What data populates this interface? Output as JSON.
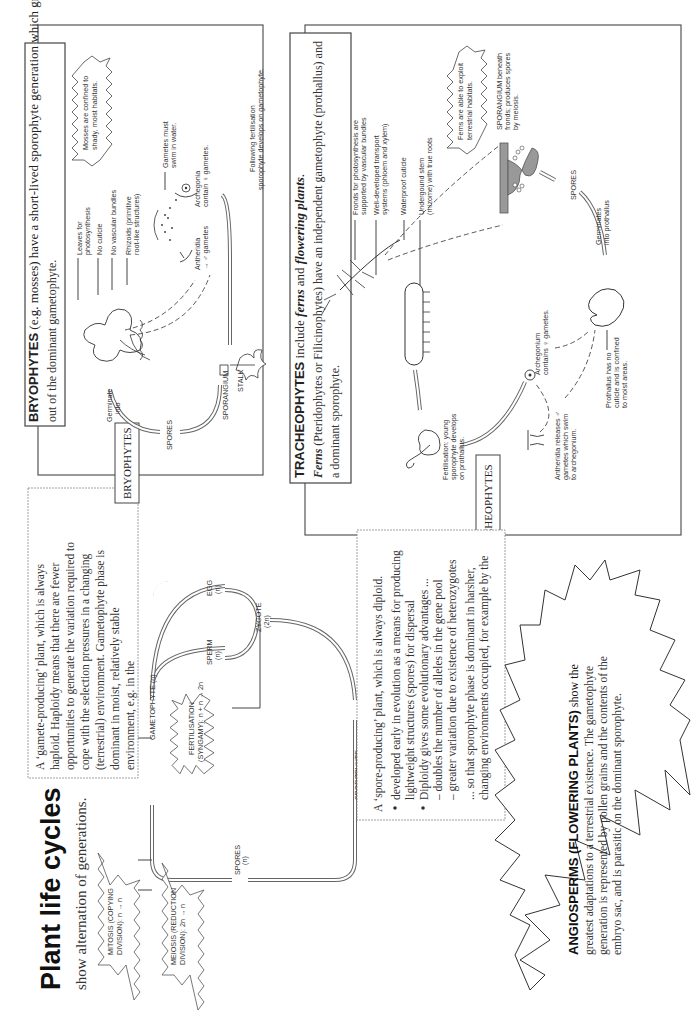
{
  "title": {
    "main": "Plant life cycles",
    "subtitle": "show alternation of generations."
  },
  "gametophyte_note": {
    "lines": [
      "A ‘gamete-producing’ plant, which is always",
      "haploid. Haploidy means that there are fewer",
      "opportunities to generate the variation required to",
      "cope with the selection pressures in a changing",
      "(terrestrial) environment. Gametophyte phase is",
      "dominant in moist, relatively stable",
      "environment, e.g. in the"
    ]
  },
  "sporophyte_note": {
    "intro": "A ‘spore-producing’ plant, which is always diploid.",
    "bullets": [
      {
        "lines": [
          "developed early in evolution as a means for producing",
          "lightweight structures (spores) for dispersal"
        ]
      },
      {
        "lines": [
          "Diploidy gives some evolutionary advantages ...",
          "– doubles the number of alleles in the gene pool",
          "– greater variation due to existence of heterozygotes"
        ]
      }
    ],
    "conclusion": [
      "... so that sporophyte phase is dominant in harsher,",
      "changing environments occupied, for example by the"
    ]
  },
  "cycle": {
    "gametophyte": "GAMETOPHYTE (n)",
    "sperm": [
      "SPERM",
      "(n)"
    ],
    "egg": [
      "EGG",
      "(n)"
    ],
    "zygote": [
      "ZYGOTE",
      "(2n)"
    ],
    "sporophyte": [
      "SPOROPHYTE",
      "(2n)"
    ],
    "spores": [
      "SPORES",
      "(n)"
    ],
    "fertilisation": [
      "FERTILISATION",
      "(SYNGAMY): n + n → 2n"
    ],
    "mitosis": [
      "MITOSIS (COPYING",
      "DIVISION): n → n"
    ],
    "meiosis": [
      "MEIOSIS (REDUCTION",
      "DIVISION): 2n → n"
    ]
  },
  "bryophytes": {
    "tag": "BRYOPHYTES",
    "heading_bold": "BRYOPHYTES",
    "heading_rest": " (e.g. mosses) have a short-lived sporophyte generation which grows",
    "heading_line2": "out of the dominant gametophyte.",
    "callout": [
      "Mosses are confined to",
      "shady, moist habitats."
    ],
    "labels": {
      "leaves": [
        "Leaves for",
        "photosynthesis"
      ],
      "cuticle": [
        "No cuticle"
      ],
      "vascular": [
        "No vascular bundles"
      ],
      "rhizoids": [
        "Rhizoids (primitive",
        "root-like structures)"
      ],
      "gametes_swim": [
        "Gametes must",
        "swim in water."
      ],
      "antheridia": [
        "Antheridia",
        "→ ♂ gametes"
      ],
      "archegonia": [
        "Archegonia",
        "contain ♀ gametes."
      ],
      "following": [
        "Following fertilisation",
        "sporophyte develops on gametophyte."
      ],
      "sporangium": "SPORANGIUM",
      "stalk": "STALK",
      "spores": "SPORES",
      "germinate": [
        "Germinate",
        "into"
      ]
    }
  },
  "tracheophytes": {
    "tag": "TRACHEOPHYTES",
    "heading_bold": "TRACHEOPHYTES",
    "heading_rest_a": " include ",
    "heading_ferns": "ferns",
    "heading_and": " and ",
    "heading_flowering": "flowering plants",
    "heading_end": ".",
    "line2_ferns": "Ferns",
    "line2_rest": " (Pteridophytes or Filicinophytes) have an independent gametophyte (prothallus) and",
    "line3": "a dominant sporophyte.",
    "callout": [
      "Ferns are able to exploit",
      "terrestrial habitats."
    ],
    "labels": {
      "fronds": [
        "Fronds for photosynthesis are",
        "supported by vascular bundles"
      ],
      "transport": [
        "Well-developed transport",
        "systems (phloem and xylem)"
      ],
      "cuticle": [
        "Waterproof cuticle"
      ],
      "rhizome": [
        "Undergound stem",
        "(rhizome) with true roots"
      ],
      "sporangium": [
        "SPORANGIUM beneath",
        "fronds; produces spores",
        "by meiosis."
      ],
      "spores": "SPORES",
      "germinates": [
        "Germinates",
        "into prothallus"
      ],
      "archegonium": [
        "Archegonium",
        "contains ♀ gametes."
      ],
      "prothallus": [
        "Prothallus has no",
        "cuticle and is confined",
        "to moist areas."
      ],
      "antheridia": [
        "Antheridia releases ♂",
        "gametes which swim",
        "to archegonium."
      ],
      "fertilisation": [
        "Fertilisation: young",
        "sporophyte develops",
        "on prothallus."
      ]
    }
  },
  "angiosperms": {
    "heading_bold": "ANGIOSPERMS (FLOWERING PLANTS)",
    "heading_rest": " show the",
    "lines": [
      "greatest adaptations to a terrestrial existence. The gametophyte",
      "generation is represented by pollen grains and the contents of the",
      "embryo sac, and is parasitic on the dominant sporophyte."
    ]
  }
}
